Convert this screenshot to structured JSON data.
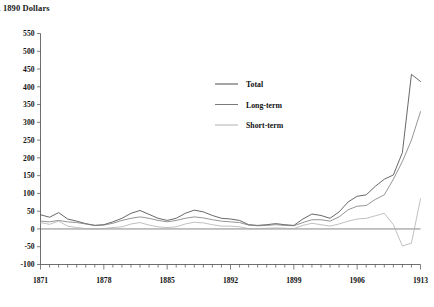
{
  "title": "l. 1890 Dollars",
  "chart_data": {
    "type": "line",
    "title": "l. 1890 Dollars",
    "xlabel": "",
    "ylabel": "",
    "ylim": [
      -100,
      550
    ],
    "ytick_step": 50,
    "yticks": [
      -100,
      -50,
      0,
      50,
      100,
      150,
      200,
      250,
      300,
      350,
      400,
      450,
      500,
      550
    ],
    "ytick_labels": [
      "-100",
      "-50",
      "0",
      "50",
      "100",
      "150",
      "200",
      "250",
      "300",
      "350",
      "400",
      "450",
      "500",
      "550"
    ],
    "xlim": [
      1871,
      1913
    ],
    "xticks": [
      1871,
      1878,
      1885,
      1892,
      1899,
      1906,
      1913
    ],
    "xtick_labels": [
      "1871",
      "1878",
      "1885",
      "1892",
      "1899",
      "1906",
      "1913"
    ],
    "x_minor_tick_step": 1,
    "grid": false,
    "legend_position": "upper-center",
    "zero_line": true,
    "x": [
      1871,
      1872,
      1873,
      1874,
      1875,
      1876,
      1877,
      1878,
      1879,
      1880,
      1881,
      1882,
      1883,
      1884,
      1885,
      1886,
      1887,
      1888,
      1889,
      1890,
      1891,
      1892,
      1893,
      1894,
      1895,
      1896,
      1897,
      1898,
      1899,
      1900,
      1901,
      1902,
      1903,
      1904,
      1905,
      1906,
      1907,
      1908,
      1909,
      1910,
      1911,
      1912,
      1913
    ],
    "series": [
      {
        "name": "Total",
        "color": "#4d4d4d",
        "values": [
          40,
          33,
          46,
          28,
          22,
          15,
          10,
          12,
          20,
          30,
          44,
          52,
          41,
          30,
          24,
          30,
          44,
          53,
          48,
          38,
          30,
          28,
          24,
          12,
          10,
          12,
          15,
          12,
          10,
          28,
          42,
          38,
          30,
          48,
          76,
          92,
          96,
          120,
          140,
          152,
          215,
          435,
          415
        ]
      },
      {
        "name": "Long-term",
        "color": "#7a7a7a",
        "values": [
          22,
          20,
          24,
          20,
          18,
          14,
          10,
          11,
          16,
          24,
          30,
          34,
          30,
          24,
          20,
          24,
          30,
          34,
          31,
          26,
          22,
          20,
          18,
          11,
          9,
          10,
          12,
          10,
          9,
          18,
          26,
          26,
          22,
          34,
          54,
          64,
          66,
          83,
          96,
          140,
          190,
          250,
          330
        ]
      },
      {
        "name": "Short-term",
        "color": "#b0b0b0",
        "values": [
          18,
          13,
          22,
          8,
          4,
          1,
          0,
          1,
          4,
          6,
          14,
          18,
          11,
          6,
          4,
          6,
          14,
          19,
          17,
          12,
          8,
          8,
          6,
          1,
          1,
          2,
          3,
          2,
          1,
          10,
          16,
          12,
          8,
          14,
          22,
          28,
          30,
          37,
          44,
          12,
          -48,
          -40,
          85
        ]
      }
    ],
    "legend": [
      "Total",
      "Long-term",
      "Short-term"
    ]
  }
}
